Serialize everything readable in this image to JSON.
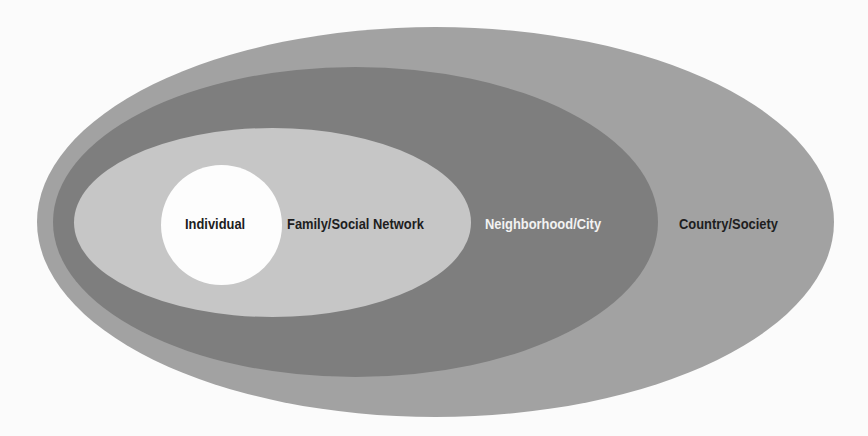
{
  "diagram": {
    "type": "nested-ellipses",
    "layers": [
      {
        "id": "country",
        "label": "Country/Society",
        "fill": "#a2a2a2",
        "text_color": "#1e1e1e"
      },
      {
        "id": "neighborhood",
        "label": "Neighborhood/City",
        "fill": "#7e7e7e",
        "text_color": "#f2f2f2"
      },
      {
        "id": "family",
        "label": "Family/Social Network",
        "fill": "#c6c6c6",
        "text_color": "#1e1e1e"
      },
      {
        "id": "individual",
        "label": "Individual",
        "fill": "#fdfdfd",
        "text_color": "#1e1e1e"
      }
    ]
  }
}
